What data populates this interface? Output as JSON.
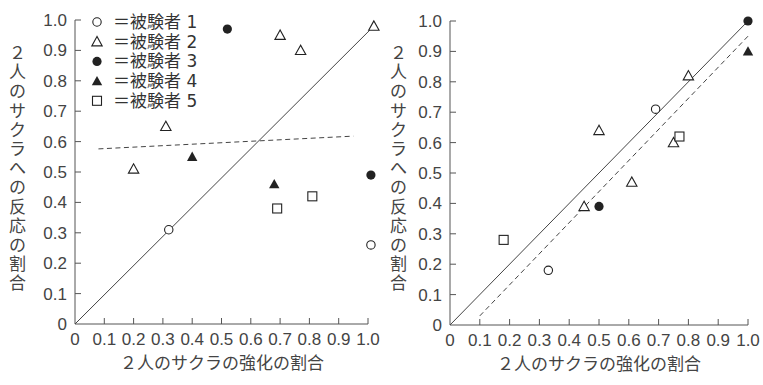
{
  "chart_data": [
    {
      "type": "scatter",
      "title": "",
      "xlabel": "２人のサクラの強化の割合",
      "ylabel": "２人のサクラへの反応の割合",
      "xlim": [
        0,
        1.0
      ],
      "ylim": [
        0,
        1.0
      ],
      "x_ticks": [
        "0",
        "0.1",
        "0.2",
        "0.3",
        "0.4",
        "0.5",
        "0.6",
        "0.7",
        "0.8",
        "0.9",
        "1.0"
      ],
      "y_ticks": [
        "0",
        "0.1",
        "0.2",
        "0.3",
        "0.4",
        "0.5",
        "0.6",
        "0.7",
        "0.8",
        "0.9",
        "1.0"
      ],
      "grid": false,
      "legend_position": "upper-left",
      "legend": [
        {
          "marker": "open-circle",
          "label": "＝被験者 1"
        },
        {
          "marker": "open-triangle",
          "label": "＝被験者 2"
        },
        {
          "marker": "filled-circle",
          "label": "＝被験者 3"
        },
        {
          "marker": "filled-triangle",
          "label": "＝被験者 4"
        },
        {
          "marker": "open-square",
          "label": "＝被験者 5"
        }
      ],
      "series": [
        {
          "name": "被験者 1",
          "marker": "open-circle",
          "points": [
            [
              0.32,
              0.31
            ],
            [
              1.01,
              0.26
            ]
          ]
        },
        {
          "name": "被験者 2",
          "marker": "open-triangle",
          "points": [
            [
              0.2,
              0.51
            ],
            [
              0.31,
              0.65
            ],
            [
              0.7,
              0.95
            ],
            [
              0.77,
              0.9
            ],
            [
              1.02,
              0.98
            ]
          ]
        },
        {
          "name": "被験者 3",
          "marker": "filled-circle",
          "points": [
            [
              0.52,
              0.97
            ],
            [
              1.01,
              0.49
            ]
          ]
        },
        {
          "name": "被験者 4",
          "marker": "filled-triangle",
          "points": [
            [
              0.4,
              0.55
            ],
            [
              0.68,
              0.46
            ]
          ]
        },
        {
          "name": "被験者 5",
          "marker": "open-square",
          "points": [
            [
              0.69,
              0.38
            ],
            [
              0.81,
              0.42
            ]
          ]
        }
      ],
      "lines": [
        {
          "style": "solid",
          "from": [
            0,
            0
          ],
          "to": [
            1.02,
            0.98
          ],
          "meaning": "matching diagonal"
        },
        {
          "style": "dashed",
          "from": [
            0.08,
            0.576
          ],
          "to": [
            0.95,
            0.618
          ],
          "meaning": "fitted line"
        }
      ]
    },
    {
      "type": "scatter",
      "title": "",
      "xlabel": "２人のサクラの強化の割合",
      "ylabel": "２人のサクラへの反応の割合",
      "xlim": [
        0,
        1.0
      ],
      "ylim": [
        0,
        1.0
      ],
      "x_ticks": [
        "0",
        "0.1",
        "0.2",
        "0.3",
        "0.4",
        "0.5",
        "0.6",
        "0.7",
        "0.8",
        "0.9",
        "1.0"
      ],
      "y_ticks": [
        "0",
        "0.1",
        "0.2",
        "0.3",
        "0.4",
        "0.5",
        "0.6",
        "0.7",
        "0.8",
        "0.9",
        "1.0"
      ],
      "grid": false,
      "series": [
        {
          "name": "被験者 1",
          "marker": "open-circle",
          "points": [
            [
              0.33,
              0.18
            ],
            [
              0.69,
              0.71
            ]
          ]
        },
        {
          "name": "被験者 2",
          "marker": "open-triangle",
          "points": [
            [
              0.45,
              0.39
            ],
            [
              0.5,
              0.64
            ],
            [
              0.61,
              0.47
            ],
            [
              0.75,
              0.6
            ],
            [
              0.8,
              0.82
            ]
          ]
        },
        {
          "name": "被験者 3",
          "marker": "filled-circle",
          "points": [
            [
              0.5,
              0.39
            ],
            [
              1.0,
              1.0
            ]
          ]
        },
        {
          "name": "被験者 4",
          "marker": "filled-triangle",
          "points": [
            [
              1.0,
              0.9
            ]
          ]
        },
        {
          "name": "被験者 5",
          "marker": "open-square",
          "points": [
            [
              0.18,
              0.28
            ],
            [
              0.77,
              0.62
            ]
          ]
        }
      ],
      "lines": [
        {
          "style": "solid",
          "from": [
            0,
            0
          ],
          "to": [
            1.0,
            1.0
          ],
          "meaning": "matching diagonal"
        },
        {
          "style": "dashed",
          "from": [
            0.1,
            0.03
          ],
          "to": [
            1.0,
            0.95
          ],
          "meaning": "fitted line"
        }
      ]
    }
  ],
  "colors": {
    "axis": "#555555",
    "marker": "#222222",
    "line": "#444444",
    "text": "#444444"
  }
}
